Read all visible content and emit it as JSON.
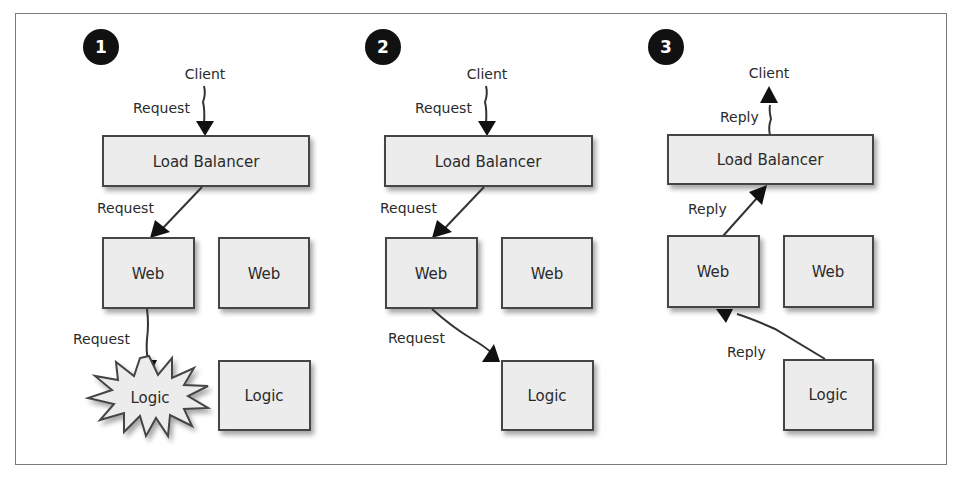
{
  "colors": {
    "box_fill": "#ececec",
    "box_stroke": "#444444",
    "ink": "#2a2a2a",
    "badge": "#111111",
    "frame": "#7a7a7a"
  },
  "panels": [
    {
      "step": "1",
      "scenario": "Logic server fails while handling request",
      "client": "Client",
      "load_balancer": "Load Balancer",
      "web": [
        "Web",
        "Web"
      ],
      "logic": [
        "Logic",
        "Logic"
      ],
      "failed_node": "logic-1",
      "edges": [
        {
          "from": "client",
          "to": "load-balancer",
          "label": "Request"
        },
        {
          "from": "load-balancer",
          "to": "web-1",
          "label": "Request"
        },
        {
          "from": "web-1",
          "to": "logic-1",
          "label": "Request"
        }
      ]
    },
    {
      "step": "2",
      "scenario": "Request rerouted to healthy logic server",
      "client": "Client",
      "load_balancer": "Load Balancer",
      "web": [
        "Web",
        "Web"
      ],
      "logic": [
        "Logic"
      ],
      "edges": [
        {
          "from": "client",
          "to": "load-balancer",
          "label": "Request"
        },
        {
          "from": "load-balancer",
          "to": "web-1",
          "label": "Request"
        },
        {
          "from": "web-1",
          "to": "logic-2",
          "label": "Request"
        }
      ]
    },
    {
      "step": "3",
      "scenario": "Reply flows back to client",
      "client": "Client",
      "load_balancer": "Load Balancer",
      "web": [
        "Web",
        "Web"
      ],
      "logic": [
        "Logic"
      ],
      "edges": [
        {
          "from": "logic-2",
          "to": "web-1",
          "label": "Reply"
        },
        {
          "from": "web-1",
          "to": "load-balancer",
          "label": "Reply"
        },
        {
          "from": "load-balancer",
          "to": "client",
          "label": "Reply"
        }
      ]
    }
  ]
}
